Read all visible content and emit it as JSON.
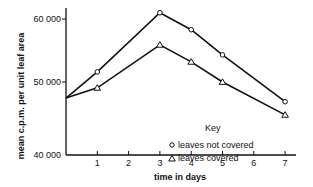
{
  "chart_data": {
    "type": "line",
    "title": "",
    "xlabel": "time in days",
    "ylabel": "mean c.p.m. per unit leaf area",
    "x_ticks": [
      "1",
      "2",
      "3",
      "4",
      "5",
      "6",
      "7"
    ],
    "y_ticks": [
      "40 000",
      "50 000",
      "60 000"
    ],
    "xlim": [
      0,
      7
    ],
    "ylim": [
      40000,
      62000
    ],
    "grid": false,
    "legend": {
      "title": "Key",
      "position": "center-right"
    },
    "series": [
      {
        "name": "leaves not covered",
        "marker": "circle",
        "x": [
          0,
          1,
          3,
          4,
          5,
          7
        ],
        "y": [
          47800,
          51600,
          61000,
          58300,
          54300,
          47300
        ]
      },
      {
        "name": "leaves covered",
        "marker": "triangle",
        "x": [
          0,
          1,
          3,
          4,
          5,
          7
        ],
        "y": [
          47800,
          49200,
          55900,
          53200,
          50000,
          45500
        ]
      }
    ]
  },
  "legend": {
    "title": "Key",
    "item_0": "leaves not covered",
    "item_1": "leaves covered"
  }
}
